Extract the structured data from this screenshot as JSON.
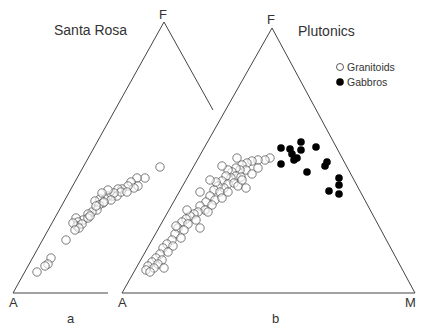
{
  "chart_data": [
    {
      "type": "scatter",
      "subtype": "ternary-AFM",
      "panel_label": "a",
      "title": "Santa Rosa",
      "vertices": {
        "top": "F",
        "bottom_left": "A",
        "bottom_right": "M"
      },
      "vertex_labels_visible": [
        "F",
        "A"
      ],
      "note": "Cropped triangle: right side truncated partway, base truncated before M",
      "legend": [],
      "series": [
        {
          "name": "Santa Rosa samples",
          "marker": "open-circle",
          "points_px": [
            [
              160,
              167
            ],
            [
              145,
              178
            ],
            [
              137,
              178
            ],
            [
              131,
              182
            ],
            [
              138,
              186
            ],
            [
              134,
              188
            ],
            [
              128,
              186
            ],
            [
              122,
              189
            ],
            [
              118,
              189
            ],
            [
              112,
              196
            ],
            [
              117,
              196
            ],
            [
              108,
              196
            ],
            [
              121,
              192
            ],
            [
              127,
              192
            ],
            [
              114,
              193
            ],
            [
              105,
              199
            ],
            [
              111,
              200
            ],
            [
              100,
              199
            ],
            [
              95,
              201
            ],
            [
              103,
              203
            ],
            [
              99,
              205
            ],
            [
              97,
              210
            ],
            [
              104,
              202
            ],
            [
              92,
              212
            ],
            [
              88,
              214
            ],
            [
              83,
              220
            ],
            [
              76,
              218
            ],
            [
              78,
              222
            ],
            [
              77,
              226
            ],
            [
              88,
              218
            ],
            [
              82,
              224
            ],
            [
              79,
              228
            ],
            [
              66,
              240
            ],
            [
              51,
              258
            ],
            [
              48,
              264
            ],
            [
              45,
              266
            ],
            [
              37,
              272
            ],
            [
              108,
              190
            ],
            [
              102,
              193
            ],
            [
              96,
              206
            ],
            [
              90,
              216
            ],
            [
              73,
              223
            ],
            [
              75,
              230
            ]
          ]
        }
      ]
    },
    {
      "type": "scatter",
      "subtype": "ternary-AFM",
      "panel_label": "b",
      "title": "Plutonics",
      "vertices": {
        "top": "F",
        "bottom_left": "A",
        "bottom_right": "M"
      },
      "vertex_labels_visible": [
        "F",
        "A",
        "M"
      ],
      "legend": [
        "Granitoids",
        "Gabbros"
      ],
      "legend_position": "upper-right",
      "series": [
        {
          "name": "Granitoids",
          "marker": "open-circle",
          "points_px": [
            [
              270,
              158
            ],
            [
              265,
              160
            ],
            [
              258,
              160
            ],
            [
              252,
              161
            ],
            [
              247,
              163
            ],
            [
              242,
              165
            ],
            [
              246,
              170
            ],
            [
              240,
              170
            ],
            [
              236,
              168
            ],
            [
              232,
              172
            ],
            [
              228,
              170
            ],
            [
              236,
              176
            ],
            [
              241,
              177
            ],
            [
              231,
              178
            ],
            [
              226,
              176
            ],
            [
              222,
              181
            ],
            [
              228,
              184
            ],
            [
              234,
              183
            ],
            [
              238,
              186
            ],
            [
              224,
              188
            ],
            [
              218,
              186
            ],
            [
              214,
              190
            ],
            [
              220,
              192
            ],
            [
              228,
              192
            ],
            [
              210,
              196
            ],
            [
              215,
              200
            ],
            [
              222,
              198
            ],
            [
              206,
              202
            ],
            [
              212,
              205
            ],
            [
              200,
              206
            ],
            [
              205,
              210
            ],
            [
              198,
              212
            ],
            [
              208,
              212
            ],
            [
              194,
              214
            ],
            [
              190,
              216
            ],
            [
              186,
              219
            ],
            [
              196,
              220
            ],
            [
              182,
              222
            ],
            [
              188,
              224
            ],
            [
              178,
              228
            ],
            [
              184,
              230
            ],
            [
              175,
              234
            ],
            [
              181,
              238
            ],
            [
              172,
              240
            ],
            [
              167,
              244
            ],
            [
              173,
              246
            ],
            [
              163,
              248
            ],
            [
              168,
              252
            ],
            [
              160,
              254
            ],
            [
              156,
              258
            ],
            [
              162,
              260
            ],
            [
              152,
              262
            ],
            [
              158,
              264
            ],
            [
              148,
              266
            ],
            [
              154,
              268
            ],
            [
              146,
              270
            ],
            [
              150,
              272
            ],
            [
              200,
              192
            ],
            [
              216,
              182
            ],
            [
              242,
              180
            ],
            [
              252,
              174
            ],
            [
              258,
              168
            ],
            [
              237,
              158
            ],
            [
              222,
              166
            ],
            [
              246,
              188
            ],
            [
              187,
              210
            ],
            [
              200,
              228
            ],
            [
              164,
              268
            ],
            [
              176,
              226
            ],
            [
              210,
              180
            ]
          ]
        },
        {
          "name": "Gabbros",
          "marker": "filled-circle",
          "points_px": [
            [
              281,
              148
            ],
            [
              290,
              149
            ],
            [
              301,
              142
            ],
            [
              301,
              150
            ],
            [
              316,
              147
            ],
            [
              297,
              158
            ],
            [
              294,
              160
            ],
            [
              281,
              164
            ],
            [
              292,
              154
            ],
            [
              307,
              172
            ],
            [
              325,
              166
            ],
            [
              327,
              162
            ],
            [
              339,
              178
            ],
            [
              339,
              185
            ],
            [
              329,
              191
            ],
            [
              339,
              194
            ]
          ]
        }
      ]
    }
  ],
  "labels": {
    "panel_a_title": "Santa Rosa",
    "panel_b_title": "Plutonics",
    "panel_a_caption": "a",
    "panel_b_caption": "b",
    "vertex_F": "F",
    "vertex_A": "A",
    "vertex_M": "M",
    "legend_granitoids": "Granitoids",
    "legend_gabbros": "Gabbros"
  }
}
